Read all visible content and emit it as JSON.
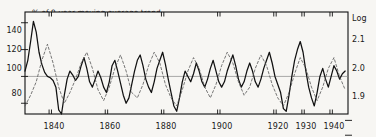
{
  "chart_data": {
    "type": "line",
    "title": "% of 9-year moving average trend",
    "annotation": "Deviations of data from 9-year trend",
    "xlabel": "",
    "ylabel": "",
    "y2label": "Log",
    "xlim": [
      1831,
      1946
    ],
    "ylim": [
      72,
      148
    ],
    "y2lim": [
      1.857,
      1.17
    ],
    "grid": false,
    "legend_position": "none",
    "baseline_value": 100,
    "xticks": [
      1840,
      1860,
      1880,
      1900,
      1920,
      1930,
      1940
    ],
    "xticklabels": [
      "1840",
      "1860",
      "1880",
      "1900",
      "1920",
      "1930",
      "1940"
    ],
    "yticks": [
      80,
      100,
      120,
      140
    ],
    "yticklabels": [
      "80",
      "100",
      "120",
      "140"
    ],
    "y2ticks": [
      1.9,
      2.0,
      2.1
    ],
    "y2ticklabels": [
      "1.9",
      "2.0",
      "2.1"
    ],
    "series": [
      {
        "name": "Deviations of data from 9-year trend",
        "style": "solid",
        "color": "#111111",
        "x": [
          1831,
          1832,
          1833,
          1834,
          1835,
          1836,
          1837,
          1838,
          1839,
          1840,
          1841,
          1842,
          1843,
          1844,
          1845,
          1846,
          1847,
          1848,
          1849,
          1850,
          1851,
          1852,
          1853,
          1854,
          1855,
          1856,
          1857,
          1858,
          1859,
          1860,
          1861,
          1862,
          1863,
          1864,
          1865,
          1866,
          1867,
          1868,
          1869,
          1870,
          1871,
          1872,
          1873,
          1874,
          1875,
          1876,
          1877,
          1878,
          1879,
          1880,
          1881,
          1882,
          1883,
          1884,
          1885,
          1886,
          1887,
          1888,
          1889,
          1890,
          1891,
          1892,
          1893,
          1894,
          1895,
          1896,
          1897,
          1898,
          1899,
          1900,
          1901,
          1902,
          1903,
          1904,
          1905,
          1906,
          1907,
          1908,
          1909,
          1910,
          1911,
          1912,
          1913,
          1914,
          1915,
          1916,
          1917,
          1918,
          1919,
          1920,
          1921,
          1922,
          1923,
          1924,
          1925,
          1926,
          1927,
          1928,
          1929,
          1930,
          1931,
          1932,
          1933,
          1934,
          1935,
          1936,
          1937,
          1938,
          1939,
          1940,
          1941,
          1942,
          1943,
          1944,
          1945
        ],
        "values": [
          104,
          112,
          126,
          141,
          133,
          118,
          109,
          103,
          100,
          99,
          97,
          92,
          75,
          72,
          86,
          98,
          104,
          101,
          97,
          100,
          108,
          114,
          106,
          96,
          92,
          98,
          104,
          99,
          92,
          88,
          96,
          108,
          112,
          104,
          95,
          86,
          80,
          84,
          94,
          104,
          112,
          116,
          108,
          98,
          92,
          88,
          96,
          106,
          112,
          118,
          109,
          98,
          88,
          78,
          74,
          84,
          96,
          104,
          100,
          96,
          102,
          110,
          104,
          96,
          92,
          98,
          106,
          112,
          104,
          96,
          92,
          96,
          104,
          110,
          116,
          108,
          98,
          92,
          96,
          104,
          110,
          104,
          96,
          92,
          98,
          106,
          112,
          118,
          110,
          100,
          94,
          88,
          76,
          74,
          86,
          100,
          112,
          120,
          126,
          118,
          104,
          92,
          84,
          78,
          88,
          100,
          106,
          98,
          92,
          100,
          108,
          104,
          98,
          102,
          104
        ],
        "comment": "solid line — deviations of data from 9-year moving average trend, percent"
      },
      {
        "name": "9-year moving average trend (log scale)",
        "style": "dashed",
        "color": "#555555",
        "x": [
          1831,
          1833,
          1835,
          1837,
          1839,
          1841,
          1843,
          1845,
          1847,
          1849,
          1851,
          1853,
          1855,
          1857,
          1859,
          1861,
          1863,
          1865,
          1867,
          1869,
          1871,
          1873,
          1875,
          1877,
          1879,
          1881,
          1883,
          1885,
          1887,
          1889,
          1891,
          1893,
          1895,
          1897,
          1899,
          1901,
          1903,
          1905,
          1907,
          1909,
          1911,
          1913,
          1915,
          1917,
          1919,
          1921,
          1923,
          1925,
          1927,
          1929,
          1931,
          1933,
          1935,
          1937,
          1939,
          1941,
          1943,
          1945
        ],
        "values": [
          78,
          86,
          96,
          112,
          124,
          110,
          92,
          80,
          88,
          98,
          110,
          118,
          106,
          90,
          82,
          92,
          106,
          116,
          104,
          88,
          84,
          94,
          108,
          118,
          110,
          94,
          84,
          78,
          90,
          104,
          114,
          106,
          92,
          84,
          94,
          108,
          118,
          110,
          96,
          86,
          92,
          106,
          116,
          108,
          94,
          84,
          78,
          88,
          102,
          114,
          106,
          92,
          82,
          92,
          106,
          114,
          100,
          90
        ],
        "comment": "dashed line — secondary series on right-hand Log axis"
      }
    ]
  },
  "plot": {
    "frame_color": "#111111",
    "baseline_color": "#888888",
    "background": "#f7f6f3"
  }
}
